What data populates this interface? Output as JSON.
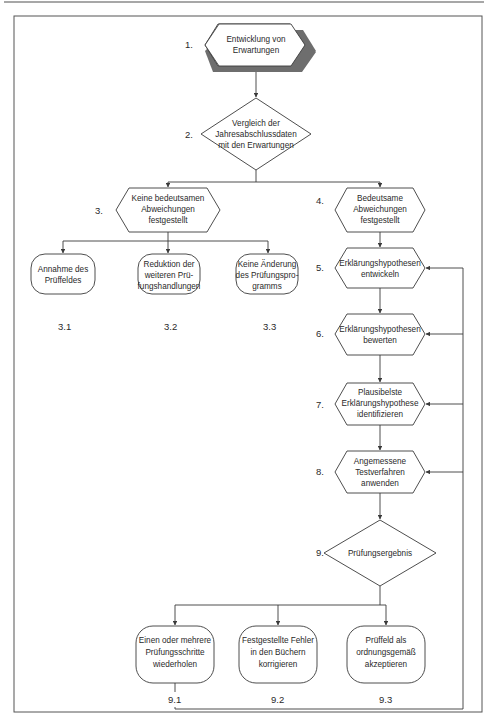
{
  "diagram": {
    "steps": [
      {
        "num": "1.",
        "lines": [
          "Entwicklung von",
          "Erwartungen"
        ],
        "shape": "hexagon-shadow"
      },
      {
        "num": "2.",
        "lines": [
          "Vergleich der",
          "Jahresabschlussdaten",
          "mit den Erwartungen"
        ],
        "shape": "diamond"
      },
      {
        "num": "3.",
        "lines": [
          "Keine bedeutsamen",
          "Abweichungen",
          "festgestellt"
        ],
        "shape": "hexagon"
      },
      {
        "num": "4.",
        "lines": [
          "Bedeutsame",
          "Abweichungen",
          "festgestellt"
        ],
        "shape": "hexagon"
      },
      {
        "num": "5.",
        "lines": [
          "Erklärungshypothesen",
          "entwickeln"
        ],
        "shape": "hexagon"
      },
      {
        "num": "6.",
        "lines": [
          "Erklärungshypothesen",
          "bewerten"
        ],
        "shape": "hexagon"
      },
      {
        "num": "7.",
        "lines": [
          "Plausibelste",
          "Erklärungshypothese",
          "identifizieren"
        ],
        "shape": "hexagon"
      },
      {
        "num": "8.",
        "lines": [
          "Angemessene",
          "Testverfahren",
          "anwenden"
        ],
        "shape": "hexagon"
      },
      {
        "num": "9.",
        "lines": [
          "Prüfungsergebnis"
        ],
        "shape": "diamond"
      }
    ],
    "outcomes_3": [
      {
        "num": "3.1",
        "lines": [
          "Annahme des",
          "Prüffeldes"
        ]
      },
      {
        "num": "3.2",
        "lines": [
          "Reduktion der",
          "weiteren Prü-",
          "fungshandlungen"
        ]
      },
      {
        "num": "3.3",
        "lines": [
          "Keine Änderung",
          "des Prüfungspro-",
          "gramms"
        ]
      }
    ],
    "outcomes_9": [
      {
        "num": "9.1",
        "lines": [
          "Einen oder mehrere",
          "Prüfungsschritte",
          "wiederholen"
        ]
      },
      {
        "num": "9.2",
        "lines": [
          "Festgestellte Fehler",
          "in den Büchern",
          "korrigieren"
        ]
      },
      {
        "num": "9.3",
        "lines": [
          "Prüffeld als",
          "ordnungsgemäß",
          "akzeptieren"
        ]
      }
    ],
    "colors": {
      "stroke": "#3a3a3a",
      "shadow": "#6e6e6e",
      "text": "#2a2a2a",
      "background": "#ffffff"
    }
  }
}
